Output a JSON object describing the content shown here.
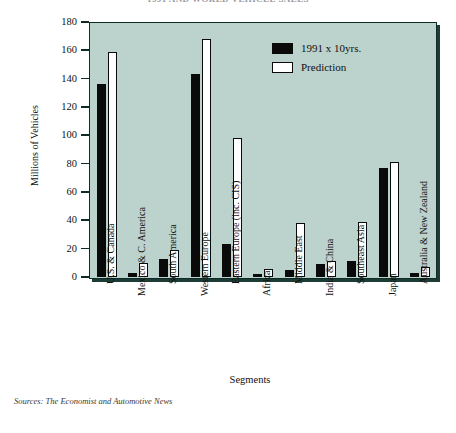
{
  "chart_data": {
    "type": "bar",
    "title": "1991 AND WORLD VEHICLE SALES",
    "xlabel": "Segments",
    "ylabel": "Millions of Vehicles",
    "ylim": [
      0,
      180
    ],
    "yticks": [
      0,
      20,
      40,
      60,
      80,
      100,
      120,
      140,
      160,
      180
    ],
    "grid": false,
    "legend_position": "top-right",
    "categories": [
      "U.S. & Canada",
      "Mexico & C. America",
      "South America",
      "Western Europe",
      "Eastern Europe (inc. CIS)",
      "Africa",
      "Middle East",
      "India & China",
      "Southeast Asia",
      "Japan",
      "Australia & New Zealand"
    ],
    "series": [
      {
        "name": "1991 x 10yrs.",
        "color": "#0a0a0a",
        "values": [
          136,
          3,
          13,
          143,
          23,
          2,
          5,
          9,
          11,
          77,
          3
        ]
      },
      {
        "name": "Prediction",
        "color": "#ffffff",
        "values": [
          159,
          10,
          19,
          168,
          98,
          6,
          38,
          11,
          39,
          81,
          7
        ]
      }
    ],
    "source_note": "Sources: The Economist and Automotive News",
    "plot_background": "#bcd2cc",
    "axis_color": "#0e2b26"
  }
}
